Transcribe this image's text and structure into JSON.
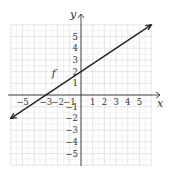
{
  "chart_data": {
    "type": "line",
    "title": "",
    "xlabel": "x",
    "ylabel": "y",
    "xlim": [
      -6,
      6
    ],
    "ylim": [
      -6,
      6
    ],
    "grid": true,
    "x_ticks": [
      -5,
      -3,
      -2,
      -1,
      1,
      2,
      3,
      4,
      5
    ],
    "x_tick_labels": [
      "−5",
      "−3",
      "−2",
      "−1",
      "1",
      "2",
      "3",
      "4",
      "5"
    ],
    "y_ticks": [
      5,
      4,
      3,
      2,
      1,
      -1,
      -2,
      -3,
      -4,
      -5
    ],
    "y_tick_labels": [
      "5",
      "4",
      "3",
      "2",
      "1",
      "−1",
      "−2",
      "−3",
      "−4",
      "−5"
    ],
    "series": [
      {
        "name": "f",
        "equation": "y = (2/3)x + 2",
        "points": [
          [
            -6,
            -2
          ],
          [
            -3,
            0
          ],
          [
            0,
            2
          ],
          [
            6,
            6
          ]
        ],
        "arrows": "both",
        "label": "f",
        "label_at": [
          -2.5,
          1.5
        ]
      }
    ]
  }
}
